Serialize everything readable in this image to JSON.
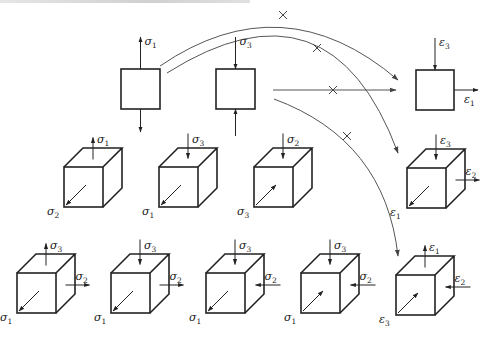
{
  "figure": {
    "colors": {
      "line": "#222222",
      "curve": "#555555",
      "background": "#ffffff"
    },
    "top_row": {
      "elements": [
        {
          "id": "uniaxial-tension",
          "x": 121,
          "y": 69,
          "w": 39,
          "h": 40,
          "arrows": [
            {
              "dir": "up-out",
              "label": "σ",
              "sub": "1"
            },
            {
              "dir": "down-out",
              "label": "",
              "sub": ""
            }
          ]
        },
        {
          "id": "uniaxial-compression",
          "x": 216,
          "y": 69,
          "w": 39,
          "h": 40,
          "arrows": [
            {
              "dir": "down-in",
              "label": "σ",
              "sub": "3"
            },
            {
              "dir": "up-in",
              "label": "",
              "sub": ""
            }
          ]
        },
        {
          "id": "plane-strain",
          "x": 416,
          "y": 70,
          "w": 38,
          "h": 40,
          "arrows": [
            {
              "dir": "down-in",
              "label": "ε",
              "sub": "3"
            },
            {
              "dir": "right-out",
              "label": "ε",
              "sub": "1"
            }
          ]
        }
      ]
    },
    "middle_row": {
      "cubes": [
        {
          "id": "cube-r2-1",
          "x": 64,
          "y": 167,
          "top": {
            "dir": "out",
            "label": "σ",
            "sub": "1"
          },
          "front": {
            "dir": "out",
            "label": "σ",
            "sub": "2"
          },
          "side": null
        },
        {
          "id": "cube-r2-2",
          "x": 159,
          "y": 167,
          "top": {
            "dir": "in",
            "label": "σ",
            "sub": "3"
          },
          "front": {
            "dir": "out",
            "label": "σ",
            "sub": "1"
          },
          "side": null
        },
        {
          "id": "cube-r2-3",
          "x": 254,
          "y": 167,
          "top": {
            "dir": "in",
            "label": "σ",
            "sub": "2"
          },
          "front": {
            "dir": "in",
            "label": "σ",
            "sub": "3"
          },
          "side": null
        },
        {
          "id": "cube-r2-4",
          "x": 407,
          "y": 168,
          "top": {
            "dir": "in",
            "label": "ε",
            "sub": "3"
          },
          "front": {
            "dir": "out",
            "label": "ε",
            "sub": "1"
          },
          "side": {
            "dir": "out",
            "label": "ε",
            "sub": "2"
          }
        }
      ]
    },
    "bottom_row": {
      "cubes": [
        {
          "id": "cube-r3-1",
          "x": 17,
          "y": 273,
          "top": {
            "dir": "out",
            "label": "σ",
            "sub": "3"
          },
          "front": {
            "dir": "out",
            "label": "σ",
            "sub": "1"
          },
          "side": {
            "dir": "out",
            "label": "σ",
            "sub": "2"
          }
        },
        {
          "id": "cube-r3-2",
          "x": 111,
          "y": 273,
          "top": {
            "dir": "in",
            "label": "σ",
            "sub": "3"
          },
          "front": {
            "dir": "out",
            "label": "σ",
            "sub": "1"
          },
          "side": {
            "dir": "out",
            "label": "σ",
            "sub": "2"
          }
        },
        {
          "id": "cube-r3-3",
          "x": 206,
          "y": 273,
          "top": {
            "dir": "in",
            "label": "σ",
            "sub": "3"
          },
          "front": {
            "dir": "out",
            "label": "σ",
            "sub": "1"
          },
          "side": {
            "dir": "in",
            "label": "σ",
            "sub": "2"
          }
        },
        {
          "id": "cube-r3-4",
          "x": 301,
          "y": 273,
          "top": {
            "dir": "in",
            "label": "σ",
            "sub": "3"
          },
          "front": {
            "dir": "in",
            "label": "σ",
            "sub": "1"
          },
          "side": {
            "dir": "in",
            "label": "σ",
            "sub": "2"
          }
        },
        {
          "id": "cube-r3-5",
          "x": 396,
          "y": 275,
          "top": {
            "dir": "out",
            "label": "ε",
            "sub": "1"
          },
          "front": {
            "dir": "in",
            "label": "ε",
            "sub": "3"
          },
          "side": {
            "dir": "in",
            "label": "ε",
            "sub": "2"
          }
        }
      ]
    },
    "connectors": [
      {
        "id": "curve-a",
        "path": "M160,66 Q283,-18 398,80",
        "cross": [
          283,
          15
        ]
      },
      {
        "id": "curve-b",
        "path": "M167,73 Q330,-30 398,153",
        "cross": [
          317,
          48
        ]
      },
      {
        "id": "line-c",
        "path": "M273,90 L396,90",
        "cross": [
          333,
          90
        ]
      },
      {
        "id": "curve-d",
        "path": "M274,99 Q385,140 398,256",
        "cross": [
          347,
          136
        ]
      }
    ]
  }
}
